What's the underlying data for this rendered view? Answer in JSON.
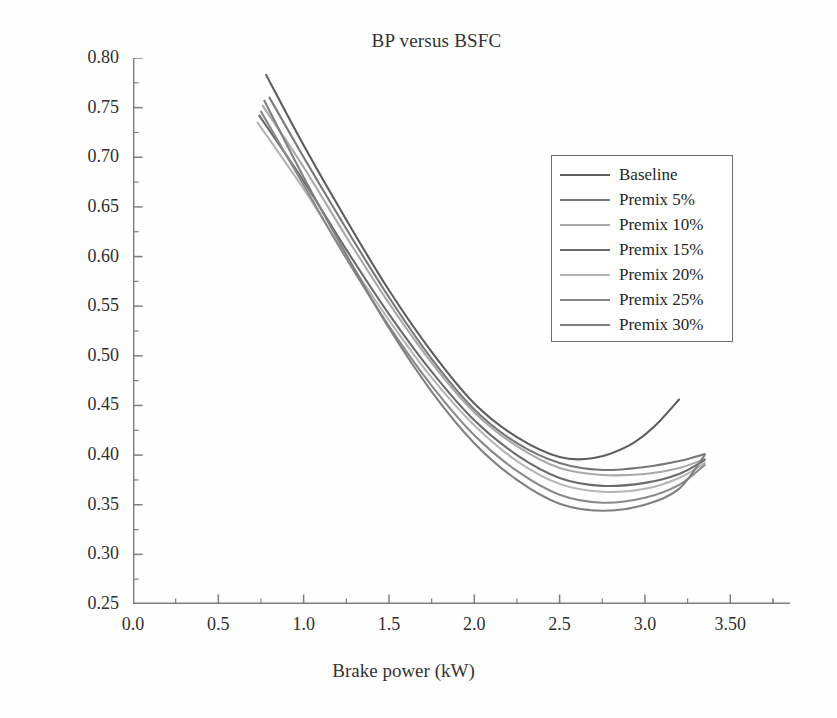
{
  "chart_data": {
    "type": "line",
    "title": "BP versus BSFC",
    "xlabel": "Brake power (kW)",
    "ylabel": "Break specific fuel consumption (kg/kWh)",
    "xlim": [
      0.0,
      3.85
    ],
    "ylim": [
      0.25,
      0.8
    ],
    "xticks": [
      0.0,
      0.5,
      1.0,
      1.5,
      2.0,
      2.5,
      3.0,
      3.5
    ],
    "xtick_labels": [
      "0.0",
      "0.5",
      "1.0",
      "1.5",
      "2.0",
      "2.5",
      "3.0",
      "3.50"
    ],
    "yticks": [
      0.25,
      0.3,
      0.35,
      0.4,
      0.45,
      0.5,
      0.55,
      0.6,
      0.65,
      0.7,
      0.75,
      0.8
    ],
    "ytick_labels": [
      "0.25",
      "0.30",
      "0.35",
      "0.40",
      "0.45",
      "0.50",
      "0.55",
      "0.60",
      "0.65",
      "0.70",
      "0.75",
      "0.80"
    ],
    "minor_ticks": true,
    "grid": false,
    "legend_position": "upper right",
    "series": [
      {
        "name": "Baseline",
        "color": "#5d5d5d",
        "x": [
          0.78,
          1.0,
          1.25,
          1.5,
          1.75,
          2.0,
          2.25,
          2.5,
          2.7,
          2.9,
          3.05,
          3.2
        ],
        "y": [
          0.783,
          0.712,
          0.637,
          0.566,
          0.504,
          0.452,
          0.418,
          0.398,
          0.397,
          0.409,
          0.428,
          0.456
        ]
      },
      {
        "name": "Premix 5%",
        "color": "#777777",
        "x": [
          0.8,
          1.0,
          1.25,
          1.5,
          1.75,
          2.0,
          2.25,
          2.5,
          2.75,
          3.0,
          3.2,
          3.35
        ],
        "y": [
          0.76,
          0.7,
          0.628,
          0.559,
          0.497,
          0.446,
          0.412,
          0.392,
          0.385,
          0.388,
          0.394,
          0.401
        ]
      },
      {
        "name": "Premix 10%",
        "color": "#a9a9a9",
        "x": [
          0.76,
          1.0,
          1.25,
          1.5,
          1.75,
          2.0,
          2.25,
          2.5,
          2.75,
          3.0,
          3.2,
          3.35
        ],
        "y": [
          0.752,
          0.69,
          0.62,
          0.553,
          0.493,
          0.443,
          0.409,
          0.387,
          0.38,
          0.381,
          0.387,
          0.396
        ]
      },
      {
        "name": "Premix 15%",
        "color": "#6b6b6b",
        "x": [
          0.74,
          1.0,
          1.25,
          1.5,
          1.75,
          2.0,
          2.25,
          2.5,
          2.75,
          3.0,
          3.2,
          3.35
        ],
        "y": [
          0.742,
          0.676,
          0.607,
          0.542,
          0.484,
          0.435,
          0.4,
          0.377,
          0.369,
          0.372,
          0.381,
          0.395
        ]
      },
      {
        "name": "Premix 20%",
        "color": "#b5b5b5",
        "x": [
          0.73,
          1.0,
          1.25,
          1.5,
          1.75,
          2.0,
          2.25,
          2.5,
          2.75,
          3.0,
          3.2,
          3.35
        ],
        "y": [
          0.735,
          0.668,
          0.6,
          0.536,
          0.478,
          0.43,
          0.394,
          0.371,
          0.363,
          0.366,
          0.377,
          0.392
        ]
      },
      {
        "name": "Premix 25%",
        "color": "#8a8a8a",
        "x": [
          0.75,
          1.0,
          1.25,
          1.5,
          1.75,
          2.0,
          2.25,
          2.5,
          2.75,
          3.0,
          3.2,
          3.35
        ],
        "y": [
          0.746,
          0.672,
          0.598,
          0.53,
          0.47,
          0.42,
          0.384,
          0.36,
          0.352,
          0.357,
          0.37,
          0.39
        ]
      },
      {
        "name": "Premix 30%",
        "color": "#808080",
        "x": [
          0.77,
          1.0,
          1.25,
          1.5,
          1.75,
          2.0,
          2.25,
          2.5,
          2.75,
          3.0,
          3.2,
          3.35
        ],
        "y": [
          0.757,
          0.68,
          0.602,
          0.528,
          0.464,
          0.412,
          0.375,
          0.351,
          0.344,
          0.35,
          0.366,
          0.4
        ]
      }
    ]
  },
  "legend": {
    "items": [
      {
        "label": "Baseline"
      },
      {
        "label": "Premix 5%"
      },
      {
        "label": "Premix 10%"
      },
      {
        "label": "Premix 15%"
      },
      {
        "label": "Premix 20%"
      },
      {
        "label": "Premix 25%"
      },
      {
        "label": "Premix 30%"
      }
    ]
  },
  "axes": {
    "spine_color": "#7d7d7d",
    "tick_color": "#7d7d7d"
  }
}
